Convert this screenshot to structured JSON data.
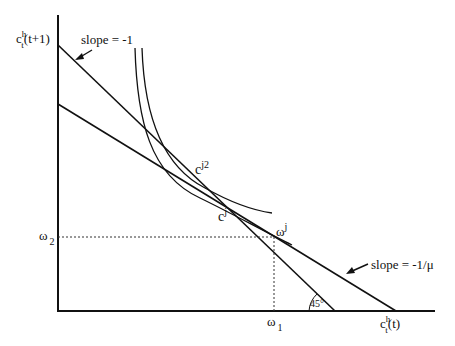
{
  "diagram": {
    "type": "economics-indifference-budget",
    "y_axis": {
      "label_base": "c",
      "label_sup": "h",
      "label_sub": "t",
      "label_tail": "(t+1)"
    },
    "x_axis": {
      "label_base": "c",
      "label_sup": "h",
      "label_sub": "t",
      "label_tail": "(t)"
    },
    "annotations": {
      "slope_steep": "slope = -1",
      "slope_flat": "slope = -1/μ",
      "point_cj2_base": "c",
      "point_cj2_sup": "j2",
      "point_cj_base": "c",
      "point_cj_sup": "j",
      "endowment_base": "ω",
      "endowment_sup": "j",
      "omega1_base": "ω",
      "omega1_sub": "1",
      "omega2_base": "ω",
      "omega2_sub": "2",
      "angle": "45°"
    },
    "colors": {
      "line": "#111111",
      "background": "#ffffff"
    }
  }
}
